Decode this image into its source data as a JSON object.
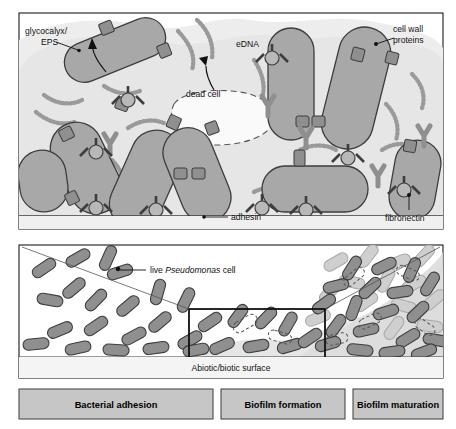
{
  "figure": {
    "top_panel": {
      "name": "magnified-biofilm-matrix",
      "labels": {
        "glycocalyx": "glycocalyx/",
        "glycocalyx_line2": "EPS",
        "edna": "eDNA",
        "dead_cell": "dead cell",
        "cell_wall_proteins": "cell wall",
        "cell_wall_proteins_line2": "proteins",
        "adhesin": "adhesin",
        "fibronectin": "fibronectin"
      }
    },
    "bottom_panel": {
      "name": "biofilm-progression",
      "labels": {
        "live_cell_prefix": "live ",
        "live_cell_genus": "Pseudomonas",
        "live_cell_suffix": " cell",
        "surface": "Abiotic/biotic surface"
      }
    },
    "stages": [
      {
        "label": "Bacterial adhesion"
      },
      {
        "label": "Biofilm formation"
      },
      {
        "label": "Biofilm maturation"
      }
    ],
    "colors": {
      "cell_fill": "#a8a8a8",
      "cell_fill_light": "#c9c9c9",
      "cell_stroke": "#3d3d3d",
      "matrix_fill": "#ededed",
      "eps_halo": "#e0e0e0",
      "connector": "#8f8f8f",
      "stage_box_fill": "#c6c6c6",
      "panel_border": "#1a1a1a",
      "surface_band": "#f0f0f0"
    }
  }
}
